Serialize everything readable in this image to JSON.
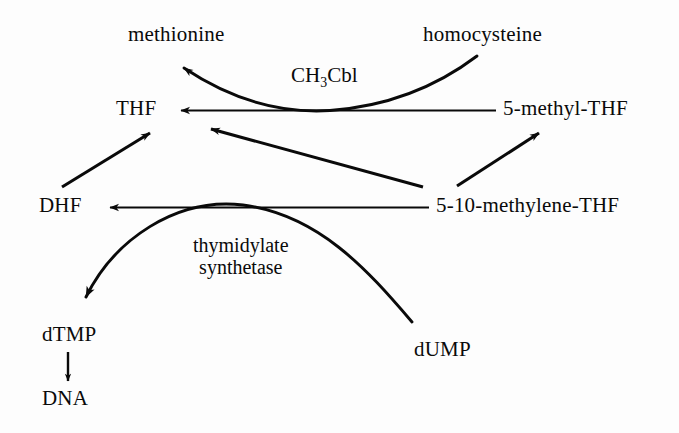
{
  "diagram": {
    "background_color": "#fdfdfd",
    "ink_color": "#0a0a0a",
    "nodes": [
      {
        "id": "methionine",
        "label": "methionine",
        "x": 128,
        "y": 22,
        "font_size": 21
      },
      {
        "id": "homocysteine",
        "label": "homocysteine",
        "x": 423,
        "y": 22,
        "font_size": 21
      },
      {
        "id": "thf",
        "label": "THF",
        "x": 116,
        "y": 96,
        "font_size": 21
      },
      {
        "id": "5-methyl-thf",
        "label": "5-methyl-THF",
        "x": 503,
        "y": 96,
        "font_size": 21
      },
      {
        "id": "dhf",
        "label": "DHF",
        "x": 39,
        "y": 193,
        "font_size": 21
      },
      {
        "id": "5-10-methylene-thf",
        "label": "5-10-methylene-THF",
        "x": 436,
        "y": 193,
        "font_size": 21
      },
      {
        "id": "dtmp",
        "label": "dTMP",
        "x": 42,
        "y": 322,
        "font_size": 21
      },
      {
        "id": "dump",
        "label": "dUMP",
        "x": 414,
        "y": 337,
        "font_size": 21
      },
      {
        "id": "dna",
        "label": "DNA",
        "x": 42,
        "y": 386,
        "font_size": 21
      }
    ],
    "enzyme_labels": [
      {
        "id": "ch3cbl",
        "lines": [
          "CH",
          "3",
          "Cbl"
        ],
        "text": "CH3Cbl",
        "x": 291,
        "y": 64,
        "font_size": 21
      },
      {
        "id": "thymidylate-synthetase",
        "lines": [
          "thymidylate",
          "synthetase"
        ],
        "text": "thymidylate synthetase",
        "x": 193,
        "y": 235,
        "font_size": 20
      }
    ],
    "edges": [
      {
        "id": "5-methyl-thf-to-thf",
        "from": "5-methyl-THF",
        "to": "THF",
        "shape": "straight"
      },
      {
        "id": "homocysteine-to-methionine",
        "from": "homocysteine",
        "to": "methionine",
        "shape": "curve"
      },
      {
        "id": "dhf-to-thf",
        "from": "DHF",
        "to": "THF",
        "shape": "straight"
      },
      {
        "id": "methylene-thf-to-thf",
        "from": "5-10-methylene-THF",
        "to": "THF",
        "shape": "straight"
      },
      {
        "id": "methylene-thf-to-5-methyl-thf",
        "from": "5-10-methylene-THF",
        "to": "5-methyl-THF",
        "shape": "straight"
      },
      {
        "id": "methylene-thf-to-dhf",
        "from": "5-10-methylene-THF",
        "to": "DHF",
        "shape": "straight"
      },
      {
        "id": "dump-to-dtmp",
        "from": "dUMP",
        "to": "dTMP",
        "shape": "arc"
      },
      {
        "id": "dtmp-to-dna",
        "from": "dTMP",
        "to": "DNA",
        "shape": "straight"
      }
    ]
  }
}
